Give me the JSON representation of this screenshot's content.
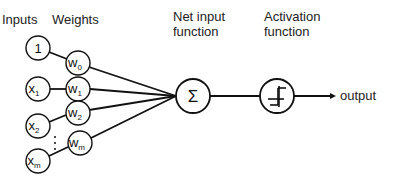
{
  "headers": {
    "inputs": "Inputs",
    "weights": "Weights",
    "net_input_line1": "Net input",
    "net_input_line2": "function",
    "activation_line1": "Activation",
    "activation_line2": "function"
  },
  "inputs": [
    {
      "base": "1",
      "sub": ""
    },
    {
      "base": "x",
      "sub": "1"
    },
    {
      "base": "x",
      "sub": "2"
    },
    {
      "base": "x",
      "sub": "m"
    }
  ],
  "weights": [
    {
      "base": "w",
      "sub": "0"
    },
    {
      "base": "w",
      "sub": "1"
    },
    {
      "base": "w",
      "sub": "2"
    },
    {
      "base": "w",
      "sub": "m"
    }
  ],
  "ellipsis": "⋮",
  "net_input_symbol": "Σ",
  "activation_icon": "step-function-icon",
  "output_label": "output"
}
